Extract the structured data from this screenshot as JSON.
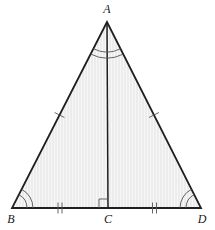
{
  "figure": {
    "canvas": {
      "width": 215,
      "height": 230,
      "background": "#ffffff"
    },
    "styles": {
      "fill_color": "#ebebeb",
      "stripe_color": "#f6f6f6",
      "outline_color": "#1f1f1f",
      "altitude_color": "#1f1f1f",
      "mark_color": "#555555",
      "label_color": "#1a1a1a",
      "outline_width": 1.8,
      "altitude_width": 1.5,
      "mark_width": 0.9
    },
    "vertices": [
      {
        "name": "A",
        "label": "A",
        "x": 107,
        "y": 22,
        "label_x": 107,
        "label_y": 13,
        "label_anchor": "middle"
      },
      {
        "name": "B",
        "label": "B",
        "x": 12,
        "y": 208,
        "label_x": 11,
        "label_y": 223,
        "label_anchor": "middle"
      },
      {
        "name": "C",
        "label": "C",
        "x": 108,
        "y": 208,
        "label_x": 108,
        "label_y": 223,
        "label_anchor": "middle"
      },
      {
        "name": "D",
        "label": "D",
        "x": 201,
        "y": 208,
        "label_x": 202,
        "label_y": 223,
        "label_anchor": "middle"
      }
    ],
    "segments": [
      {
        "name": "side-AB",
        "from": "A",
        "to": "B",
        "tick_count": 1
      },
      {
        "name": "side-AD",
        "from": "A",
        "to": "D",
        "tick_count": 1
      },
      {
        "name": "base-BD",
        "from": "B",
        "to": "D",
        "tick_count": 0
      },
      {
        "name": "altitude-AC",
        "from": "A",
        "to": "C",
        "tick_count": 0
      }
    ],
    "angle_marks": [
      {
        "name": "angle-A",
        "vertex": "A",
        "arc_count": 2,
        "radii": [
          30,
          36
        ]
      },
      {
        "name": "angle-B",
        "vertex": "B",
        "arc_count": 2,
        "radii": [
          15,
          21
        ]
      },
      {
        "name": "angle-D",
        "vertex": "D",
        "arc_count": 2,
        "radii": [
          15,
          21
        ]
      }
    ],
    "right_angle": {
      "name": "right-angle-C",
      "vertex": "C",
      "size": 9,
      "opens": "left"
    },
    "tick_marks": {
      "leg_tick_count": 1,
      "base_half_tick_count": 2
    }
  }
}
